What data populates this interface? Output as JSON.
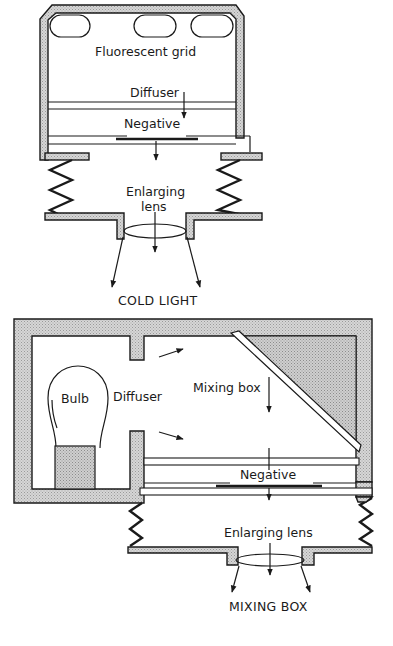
{
  "figure": {
    "cold_light": {
      "title": "COLD LIGHT",
      "labels": {
        "fluorescent_grid": "Fluorescent grid",
        "diffuser": "Diffuser",
        "negative": "Negative",
        "lens_line1": "Enlarging",
        "lens_line2": "lens"
      }
    },
    "mixing_box": {
      "title": "MIXING BOX",
      "labels": {
        "bulb": "Bulb",
        "diffuser": "Diffuser",
        "mixing_box": "Mixing box",
        "negative": "Negative",
        "enlarging_lens": "Enlarging lens"
      }
    },
    "colors": {
      "line": "#1a1a1a",
      "wall_fill": "#c9c9c9",
      "stipple_fill": "#b8b8b8",
      "background": "#ffffff"
    }
  }
}
